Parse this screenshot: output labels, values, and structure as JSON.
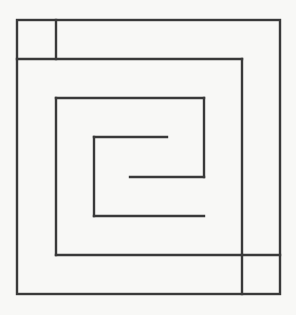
{
  "diagram": {
    "type": "square-spiral-maze",
    "stroke_color": "#3a3a3a",
    "background_color": "#f8f8f6",
    "stroke_width": 2.4,
    "outer_box": {
      "x1": 17,
      "y1": 20,
      "x2": 280,
      "y2": 294
    },
    "segments": [
      {
        "name": "top-left-cell-divider",
        "x1": 56,
        "y1": 20,
        "x2": 56,
        "y2": 59
      },
      {
        "name": "spiral-1-top",
        "x1": 17,
        "y1": 59,
        "x2": 242,
        "y2": 59
      },
      {
        "name": "spiral-1-right",
        "x1": 242,
        "y1": 59,
        "x2": 242,
        "y2": 255
      },
      {
        "name": "bottom-right-cell-top",
        "x1": 56,
        "y1": 255,
        "x2": 280,
        "y2": 255
      },
      {
        "name": "bottom-right-cell-divider",
        "x1": 242,
        "y1": 255,
        "x2": 242,
        "y2": 294
      },
      {
        "name": "spiral-2-left",
        "x1": 56,
        "y1": 98,
        "x2": 56,
        "y2": 255
      },
      {
        "name": "spiral-2-top",
        "x1": 56,
        "y1": 98,
        "x2": 204,
        "y2": 98
      },
      {
        "name": "spiral-2-right",
        "x1": 204,
        "y1": 98,
        "x2": 204,
        "y2": 177
      },
      {
        "name": "spiral-center-bar",
        "x1": 130,
        "y1": 177,
        "x2": 204,
        "y2": 177
      },
      {
        "name": "spiral-3-top",
        "x1": 94,
        "y1": 137,
        "x2": 167,
        "y2": 137
      },
      {
        "name": "spiral-3-left",
        "x1": 94,
        "y1": 137,
        "x2": 94,
        "y2": 216
      },
      {
        "name": "spiral-3-bottom",
        "x1": 94,
        "y1": 216,
        "x2": 204,
        "y2": 216
      }
    ]
  }
}
